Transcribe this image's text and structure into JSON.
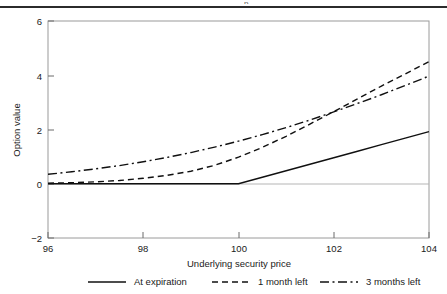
{
  "figure": {
    "top_rule": "horizontal-rule",
    "clipped_text_fragment": "p"
  },
  "chart_data": {
    "type": "line",
    "title": "",
    "subtitle": "",
    "xlabel": "Underlying security price",
    "ylabel": "Option value",
    "xlim": [
      96,
      104
    ],
    "ylim": [
      -2,
      6
    ],
    "xticks": [
      96,
      98,
      100,
      102,
      104
    ],
    "yticks": [
      -2,
      0,
      2,
      4,
      6
    ],
    "xtick_labels": [
      "96",
      "98",
      "100",
      "102",
      "104"
    ],
    "ytick_labels": [
      "−2",
      "0",
      "2",
      "4",
      "6"
    ],
    "grid": false,
    "zero_reference_line": 0,
    "legend_position": "below-axes",
    "x": [
      96,
      96.5,
      97,
      97.5,
      98,
      98.5,
      99,
      99.5,
      100,
      100.5,
      101,
      101.5,
      102,
      102.5,
      103,
      103.5,
      104
    ],
    "series": [
      {
        "name": "At expiration",
        "style": "solid",
        "values": [
          0,
          0,
          0,
          0,
          0,
          0,
          0,
          0,
          0,
          0.24,
          0.48,
          0.72,
          0.96,
          1.2,
          1.44,
          1.68,
          1.92
        ]
      },
      {
        "name": "1 month left",
        "style": "dashed",
        "values": [
          0.02,
          0.04,
          0.07,
          0.12,
          0.2,
          0.31,
          0.46,
          0.68,
          0.98,
          1.34,
          1.75,
          2.2,
          2.66,
          3.13,
          3.6,
          4.05,
          4.5
        ]
      },
      {
        "name": "3 months left",
        "style": "dash-dot",
        "values": [
          0.35,
          0.44,
          0.55,
          0.67,
          0.81,
          0.97,
          1.15,
          1.35,
          1.57,
          1.81,
          2.07,
          2.35,
          2.65,
          2.96,
          3.28,
          3.62,
          3.97
        ]
      }
    ]
  },
  "legend": {
    "items": [
      {
        "label": "At expiration",
        "style": "solid"
      },
      {
        "label": "1 month left",
        "style": "dashed"
      },
      {
        "label": "3 months left",
        "style": "dash-dot"
      }
    ]
  }
}
